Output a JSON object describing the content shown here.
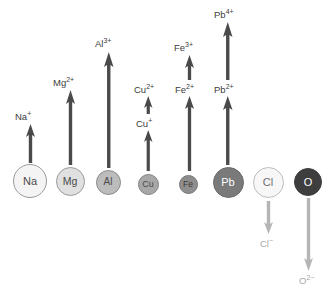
{
  "diagram": {
    "background_color": "#ffffff",
    "up_arrow_color": "#4a4a4a",
    "down_arrow_color": "#b5b5b5",
    "label_color": "#3b3b3b",
    "down_label_color": "#a8a8a8"
  },
  "atoms": [
    {
      "symbol": "Na",
      "fill": "#f4f4f4",
      "stroke": "#9a9a9a",
      "text_color": "#4a4a4a",
      "cx": 30,
      "cy": 181,
      "r": 17,
      "font_size": 11
    },
    {
      "symbol": "Mg",
      "fill": "#e0e0e0",
      "stroke": "#9a9a9a",
      "text_color": "#4a4a4a",
      "cx": 70,
      "cy": 181,
      "r": 14.5,
      "font_size": 10.5
    },
    {
      "symbol": "Al",
      "fill": "#bcbcbc",
      "stroke": "#8a8a8a",
      "text_color": "#4a4a4a",
      "cx": 108,
      "cy": 182,
      "r": 12.5,
      "font_size": 10
    },
    {
      "symbol": "Cu",
      "fill": "#a8a8a8",
      "stroke": "#808080",
      "text_color": "#4a4a4a",
      "cx": 148,
      "cy": 184,
      "r": 10.5,
      "font_size": 9
    },
    {
      "symbol": "Fe",
      "fill": "#8e8e8e",
      "stroke": "#757575",
      "text_color": "#3a3a3a",
      "cx": 188,
      "cy": 184,
      "r": 9.5,
      "font_size": 8.5
    },
    {
      "symbol": "Pb",
      "fill": "#7a7a7a",
      "stroke": "#6a6a6a",
      "text_color": "#ffffff",
      "cx": 228,
      "cy": 182,
      "r": 15.5,
      "font_size": 11
    },
    {
      "symbol": "Cl",
      "fill": "#f7f7f7",
      "stroke": "#bdbdbd",
      "text_color": "#6e6e6e",
      "cx": 268,
      "cy": 182,
      "r": 15.5,
      "font_size": 11
    },
    {
      "symbol": "O",
      "fill": "#3e3e3e",
      "stroke": "#3e3e3e",
      "text_color": "#ffffff",
      "cx": 308,
      "cy": 182,
      "r": 14,
      "font_size": 11
    }
  ],
  "ions": [
    {
      "name": "sodium-ion",
      "base": "Na",
      "charge": "+",
      "direction": "up",
      "label_x": 15,
      "label_y": 112,
      "arrow_x": 30,
      "arrow_top": 124,
      "arrow_bottom": 163,
      "arrow_width": 9,
      "head_height": 13,
      "shaft_width": 3.4
    },
    {
      "name": "magnesium-ion",
      "base": "Mg",
      "charge": "2+",
      "direction": "up",
      "label_x": 53,
      "label_y": 78,
      "arrow_x": 70,
      "arrow_top": 90,
      "arrow_bottom": 165,
      "arrow_width": 9,
      "head_height": 14,
      "shaft_width": 3.4
    },
    {
      "name": "aluminium-ion",
      "base": "Al",
      "charge": "3+",
      "direction": "up",
      "label_x": 95,
      "label_y": 39,
      "arrow_x": 109,
      "arrow_top": 52,
      "arrow_bottom": 168,
      "arrow_width": 9.5,
      "head_height": 15,
      "shaft_width": 3.4
    },
    {
      "name": "copper-i-ion",
      "base": "Cu",
      "charge": "+",
      "direction": "up",
      "label_x": 136,
      "label_y": 119,
      "arrow_x": 148,
      "arrow_top": 130,
      "arrow_bottom": 171,
      "arrow_width": 8.5,
      "head_height": 12,
      "shaft_width": 3.2
    },
    {
      "name": "copper-ii-ion",
      "base": "Cu",
      "charge": "2+",
      "direction": "up",
      "label_x": 134,
      "label_y": 85,
      "arrow_x": 148,
      "arrow_top": 96,
      "arrow_bottom": 114,
      "arrow_width": 8.5,
      "head_height": 12,
      "shaft_width": 3.2
    },
    {
      "name": "iron-ii-ion",
      "base": "Fe",
      "charge": "2+",
      "direction": "up",
      "label_x": 175,
      "label_y": 85,
      "arrow_x": 189,
      "arrow_top": 96,
      "arrow_bottom": 171,
      "arrow_width": 9,
      "head_height": 13,
      "shaft_width": 3.3
    },
    {
      "name": "iron-iii-ion",
      "base": "Fe",
      "charge": "3+",
      "direction": "up",
      "label_x": 174,
      "label_y": 43,
      "arrow_x": 189,
      "arrow_top": 55,
      "arrow_bottom": 80,
      "arrow_width": 9,
      "head_height": 13,
      "shaft_width": 3.3
    },
    {
      "name": "lead-ii-ion",
      "base": "Pb",
      "charge": "2+",
      "direction": "up",
      "label_x": 214,
      "label_y": 85,
      "arrow_x": 228,
      "arrow_top": 96,
      "arrow_bottom": 165,
      "arrow_width": 9.5,
      "head_height": 14,
      "shaft_width": 3.4
    },
    {
      "name": "lead-iv-ion",
      "base": "Pb",
      "charge": "4+",
      "direction": "up",
      "label_x": 214,
      "label_y": 10,
      "arrow_x": 228,
      "arrow_top": 22,
      "arrow_bottom": 80,
      "arrow_width": 9.5,
      "head_height": 15,
      "shaft_width": 3.4
    },
    {
      "name": "chloride-ion",
      "base": "Cl",
      "charge": "−",
      "direction": "down",
      "label_x": 260,
      "label_y": 239,
      "arrow_x": 268,
      "arrow_top": 201,
      "arrow_bottom": 234,
      "arrow_width": 9,
      "head_height": 12,
      "shaft_width": 3.4
    },
    {
      "name": "oxide-ion",
      "base": "O",
      "charge": "2−",
      "direction": "down",
      "label_x": 299,
      "label_y": 276,
      "arrow_x": 308,
      "arrow_top": 198,
      "arrow_bottom": 271,
      "arrow_width": 9,
      "head_height": 13,
      "shaft_width": 3.4
    }
  ]
}
